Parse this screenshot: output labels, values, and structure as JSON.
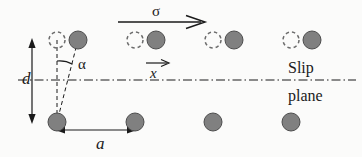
{
  "figure": {
    "type": "physics-schematic",
    "background_color": "#fbfbfa",
    "ink_color": "#1a1a1a",
    "atom_fill_color": "#808080",
    "atom_stroke_color": "#4d4d4d"
  },
  "labels": {
    "d": "d",
    "a": "a",
    "alpha": "α",
    "sigma": "σ",
    "x": "x",
    "slip": "Slip",
    "plane": "plane"
  },
  "geometry": {
    "slip_plane_y": 80,
    "top_row_y": 40,
    "bottom_row_y": 122,
    "atom_radius": 9,
    "dashed_radius": 8,
    "top_pairs_x": [
      57,
      135,
      213,
      291
    ],
    "top_pair_offset": 21,
    "bottom_atoms_x": [
      57,
      135,
      213,
      291
    ]
  },
  "arrows": {
    "sigma": {
      "x1": 118,
      "x2": 205,
      "y": 22
    },
    "x_vector": {
      "x1": 146,
      "x2": 168,
      "y": 63
    },
    "d_dimension": {
      "x": 32,
      "y1": 40,
      "y2": 122
    },
    "a_dimension": {
      "y": 130,
      "x1": 57,
      "x2": 135
    }
  },
  "annotations": {
    "slip_plane_line_style": "dash-dot",
    "angle_alpha_vertex": {
      "x": 57,
      "y": 122
    },
    "angle_alpha_arc_radius": 26
  }
}
